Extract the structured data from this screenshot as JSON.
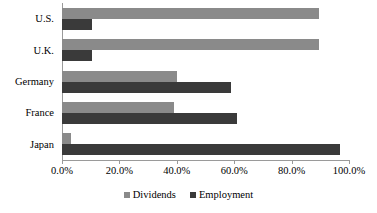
{
  "chart_data": {
    "type": "bar",
    "orientation": "horizontal",
    "title": "",
    "subtitle": "",
    "xlabel": "",
    "ylabel": "",
    "categories": [
      "U.S.",
      "U.K.",
      "Germany",
      "France",
      "Japan"
    ],
    "series": [
      {
        "name": "Dividends",
        "color": "#8a8a8a",
        "values": [
          89.5,
          89.5,
          40.0,
          39.0,
          3.0
        ]
      },
      {
        "name": "Employment",
        "color": "#3a3a3a",
        "values": [
          10.5,
          10.5,
          59.0,
          61.0,
          97.0
        ]
      }
    ],
    "xlim": [
      0,
      100
    ],
    "xticks": [
      0,
      20,
      40,
      60,
      80,
      100
    ],
    "xtick_labels": [
      "0.0%",
      "20.0%",
      "40.0%",
      "60.0%",
      "80.0%",
      "100.0%"
    ],
    "grid": false,
    "legend": {
      "position": "bottom",
      "entries": [
        {
          "label": "Dividends",
          "color": "#8a8a8a",
          "swatch": "square-swatch"
        },
        {
          "label": "Employment",
          "color": "#3a3a3a",
          "swatch": "square-swatch"
        }
      ]
    },
    "axis_color": "#9a9a9a",
    "background": "#ffffff"
  }
}
